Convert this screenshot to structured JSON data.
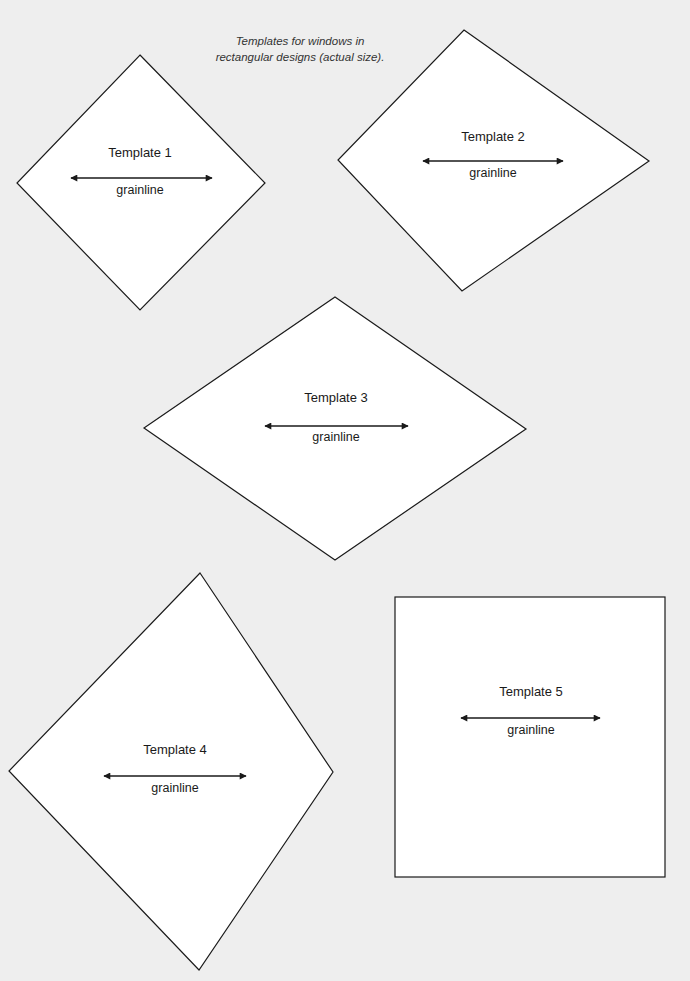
{
  "caption": {
    "line1": "Templates for windows in",
    "line2": "rectangular designs (actual size)."
  },
  "templates": [
    {
      "title": "Template 1",
      "grainline": "grainline",
      "shape": "diamond"
    },
    {
      "title": "Template 2",
      "grainline": "grainline",
      "shape": "diamond"
    },
    {
      "title": "Template 3",
      "grainline": "grainline",
      "shape": "diamond"
    },
    {
      "title": "Template 4",
      "grainline": "grainline",
      "shape": "diamond"
    },
    {
      "title": "Template 5",
      "grainline": "grainline",
      "shape": "square"
    }
  ],
  "colors": {
    "background": "#eeeeee",
    "shape_fill": "#ffffff",
    "stroke": "#1a1a1a"
  }
}
